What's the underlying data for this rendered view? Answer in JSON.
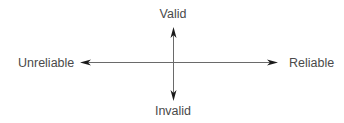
{
  "diagram": {
    "type": "quadrant-axes",
    "axes": {
      "vertical": {
        "top_label": "Valid",
        "bottom_label": "Invalid"
      },
      "horizontal": {
        "left_label": "Unreliable",
        "right_label": "Reliable"
      }
    },
    "colors": {
      "line": "#6a6a6a",
      "arrowhead": "#1a1a1a",
      "text": "#4a4a4a",
      "background": "#ffffff"
    }
  }
}
